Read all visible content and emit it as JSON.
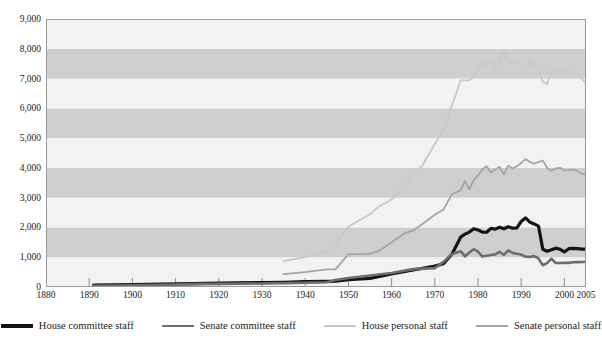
{
  "figure": {
    "title_ghost": "",
    "background": "#ffffff"
  },
  "axes": {
    "y_labels": [
      "9,000",
      "8,000",
      "7,000",
      "6,000",
      "5,000",
      "4,000",
      "3,000",
      "2,000",
      "1,000",
      "0"
    ],
    "x_labels": [
      "1880",
      "1890",
      "1900",
      "1910",
      "1920",
      "1930",
      "1940",
      "1950",
      "1960",
      "1970",
      "1980",
      "1990",
      "2000",
      "2005"
    ]
  },
  "legend": {
    "items": [
      {
        "label": "House committee staff",
        "color": "#141414",
        "width": 3.2
      },
      {
        "label": "Senate committee staff",
        "color": "#6e6e6e",
        "width": 2.6
      },
      {
        "label": "House personal staff",
        "color": "#c9c9c9",
        "width": 1.8
      },
      {
        "label": "Senate personal staff",
        "color": "#a5a5a5",
        "width": 1.8
      }
    ]
  },
  "chart_data": {
    "type": "line",
    "title": "",
    "xlabel": "",
    "ylabel": "",
    "xlim": [
      1880,
      2005
    ],
    "ylim": [
      0,
      9000
    ],
    "ytick_step": 1000,
    "grid": false,
    "banding": {
      "note": "alternating horizontal gray bands each 1,000 units, shaded bands at 1000-2000, 3000-4000, 5000-6000, 7000-8000",
      "band_color": "#cfcfcf",
      "alt_color": "#f2f2f2",
      "shaded_ranges": [
        [
          1000,
          2000
        ],
        [
          3000,
          4000
        ],
        [
          5000,
          6000
        ],
        [
          7000,
          8000
        ]
      ]
    },
    "legend_position": "bottom",
    "series": [
      {
        "name": "House committee staff",
        "color": "#141414",
        "width": 3.2,
        "x": [
          1891,
          1900,
          1910,
          1914,
          1920,
          1930,
          1935,
          1940,
          1945,
          1947,
          1950,
          1955,
          1960,
          1965,
          1970,
          1972,
          1974,
          1976,
          1977,
          1978,
          1979,
          1980,
          1981,
          1982,
          1983,
          1984,
          1985,
          1986,
          1987,
          1988,
          1989,
          1990,
          1991,
          1992,
          1993,
          1994,
          1995,
          1996,
          1997,
          1998,
          1999,
          2000,
          2001,
          2002,
          2003,
          2004,
          2005
        ],
        "y": [
          62,
          80,
          105,
          115,
          130,
          150,
          160,
          180,
          190,
          200,
          246,
          290,
          440,
          570,
          700,
          780,
          1107,
          1680,
          1776,
          1844,
          1959,
          1917,
          1843,
          1839,
          1970,
          1944,
          2009,
          1954,
          2024,
          1976,
          1986,
          2201,
          2321,
          2178,
          2118,
          2046,
          1266,
          1200,
          1250,
          1305,
          1267,
          1176,
          1287,
          1300,
          1290,
          1272,
          1272
        ]
      },
      {
        "name": "Senate committee staff",
        "color": "#6e6e6e",
        "width": 2.6,
        "x": [
          1891,
          1900,
          1910,
          1914,
          1920,
          1930,
          1935,
          1940,
          1945,
          1947,
          1950,
          1955,
          1960,
          1965,
          1970,
          1972,
          1974,
          1976,
          1977,
          1978,
          1979,
          1980,
          1981,
          1982,
          1983,
          1984,
          1985,
          1986,
          1987,
          1988,
          1989,
          1990,
          1991,
          1992,
          1993,
          1994,
          1995,
          1996,
          1997,
          1998,
          1999,
          2000,
          2001,
          2002,
          2003,
          2004,
          2005
        ],
        "y": [
          41,
          60,
          85,
          95,
          105,
          120,
          130,
          145,
          160,
          232,
          300,
          386,
          470,
          600,
          635,
          844,
          1107,
          1201,
          1028,
          1156,
          1269,
          1191,
          1022,
          1047,
          1075,
          1095,
          1178,
          1075,
          1231,
          1145,
          1116,
          1090,
          1017,
          1010,
          1037,
          958,
          732,
          800,
          950,
          805,
          805,
          815,
          810,
          830,
          835,
          840,
          845
        ]
      },
      {
        "name": "House personal staff",
        "color": "#c9c9c9",
        "width": 1.8,
        "x": [
          1935,
          1940,
          1945,
          1947,
          1950,
          1955,
          1957,
          1960,
          1963,
          1965,
          1967,
          1970,
          1972,
          1974,
          1976,
          1977,
          1978,
          1979,
          1980,
          1981,
          1982,
          1983,
          1984,
          1985,
          1986,
          1987,
          1988,
          1989,
          1990,
          1991,
          1992,
          1993,
          1994,
          1995,
          1996,
          1997,
          1998,
          1999,
          2000,
          2001,
          2002,
          2003,
          2004,
          2005
        ],
        "y": [
          870,
          1000,
          1200,
          1440,
          2030,
          2441,
          2700,
          2940,
          3400,
          3800,
          4055,
          4800,
          5280,
          6114,
          6939,
          6942,
          6944,
          7067,
          7371,
          7487,
          7511,
          7606,
          7385,
          7528,
          7920,
          7584,
          7564,
          7569,
          7496,
          7278,
          7597,
          7400,
          7390,
          6889,
          6823,
          7282,
          7269,
          7216,
          7209,
          7266,
          7134,
          7209,
          7000,
          6825
        ]
      },
      {
        "name": "Senate personal staff",
        "color": "#a5a5a5",
        "width": 1.8,
        "x": [
          1935,
          1940,
          1945,
          1947,
          1950,
          1955,
          1957,
          1960,
          1963,
          1965,
          1967,
          1970,
          1972,
          1974,
          1976,
          1977,
          1978,
          1979,
          1980,
          1981,
          1982,
          1983,
          1984,
          1985,
          1986,
          1987,
          1988,
          1989,
          1990,
          1991,
          1992,
          1993,
          1994,
          1995,
          1996,
          1997,
          1998,
          1999,
          2000,
          2001,
          2002,
          2003,
          2004,
          2005
        ],
        "y": [
          430,
          500,
          590,
          590,
          1100,
          1115,
          1210,
          1500,
          1800,
          1900,
          2100,
          2426,
          2600,
          3122,
          3251,
          3554,
          3268,
          3593,
          3746,
          3945,
          4053,
          3846,
          3949,
          4037,
          3774,
          4075,
          3977,
          4055,
          4162,
          4294,
          4200,
          4138,
          4200,
          4247,
          4000,
          3900,
          3985,
          4000,
          3911,
          3925,
          3940,
          3900,
          3800,
          3800
        ]
      }
    ]
  }
}
